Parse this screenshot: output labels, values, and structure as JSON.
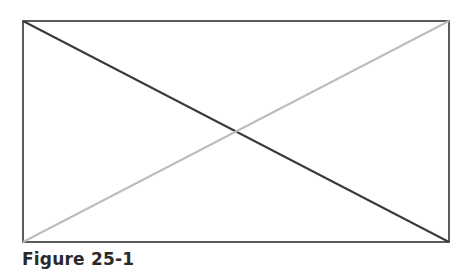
{
  "figure": {
    "caption": "Figure 25-1",
    "rect": {
      "x": 23,
      "y": 21,
      "width": 426,
      "height": 221,
      "stroke": "#333333"
    },
    "diagonals": [
      {
        "from": "top-left",
        "to": "bottom-right",
        "color": "#3a3a3a"
      },
      {
        "from": "bottom-left",
        "to": "top-right",
        "color": "#bdbdbd"
      }
    ]
  }
}
